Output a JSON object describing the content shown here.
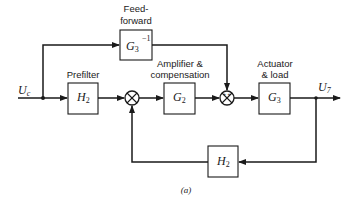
{
  "diagram": {
    "caption": "(a)",
    "input_signal": {
      "symbol": "U",
      "subscript": "c"
    },
    "output_signal": {
      "symbol": "U",
      "subscript": "7"
    },
    "blocks": {
      "feedforward": {
        "label_line1": "Feed-",
        "label_line2": "forward",
        "tf_symbol": "G",
        "tf_subscript": "3",
        "tf_superscript": "−1"
      },
      "prefilter": {
        "label": "Prefilter",
        "tf_symbol": "H",
        "tf_subscript": "2"
      },
      "amplifier": {
        "label_line1": "Amplifier &",
        "label_line2": "compensation",
        "tf_symbol": "G",
        "tf_subscript": "2"
      },
      "actuator": {
        "label_line1": "Actuator",
        "label_line2": "& load",
        "tf_symbol": "G",
        "tf_subscript": "3"
      },
      "feedback": {
        "tf_symbol": "H",
        "tf_subscript": "2"
      }
    },
    "summing_junctions": [
      {
        "id": "sum1",
        "inputs": [
          "prefilter output",
          "feedback H2 output"
        ]
      },
      {
        "id": "sum2",
        "inputs": [
          "amplifier output",
          "feedforward output"
        ],
        "signs": [
          "+",
          "+"
        ]
      }
    ],
    "colors": {
      "line": "#1a1a1a",
      "background": "#ffffff"
    }
  }
}
